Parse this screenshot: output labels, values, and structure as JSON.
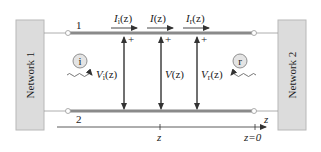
{
  "diagram": {
    "colors": {
      "network_fill": "#dcdcdc",
      "network_stroke": "#b8b8b8",
      "conductor": "#8a8a8a",
      "wire": "#9a9a9a",
      "arrow": "#333333",
      "text": "#222222"
    },
    "networks": [
      {
        "id": "network-1",
        "label": "Network 1"
      },
      {
        "id": "network-2",
        "label": "Network 2"
      }
    ],
    "conductors": [
      {
        "id": "conductor-1",
        "label": "1"
      },
      {
        "id": "conductor-2",
        "label": "2"
      }
    ],
    "currents": [
      {
        "id": "incident-current",
        "symbol": "I",
        "subscript": "i",
        "arg": "(z)"
      },
      {
        "id": "total-current",
        "symbol": "I",
        "subscript": "",
        "arg": "(z)"
      },
      {
        "id": "reflected-current",
        "symbol": "I",
        "subscript": "r",
        "arg": "(z)"
      }
    ],
    "voltages": [
      {
        "id": "incident-voltage",
        "symbol": "V",
        "subscript": "i",
        "arg": "(z)",
        "polarity": "+"
      },
      {
        "id": "total-voltage",
        "symbol": "V",
        "subscript": "",
        "arg": "(z)",
        "polarity": "+"
      },
      {
        "id": "reflected-voltage",
        "symbol": "V",
        "subscript": "r",
        "arg": "(z)",
        "polarity": "+"
      }
    ],
    "waves": [
      {
        "id": "incident-wave",
        "badge": "i",
        "direction": "right"
      },
      {
        "id": "reflected-wave",
        "badge": "r",
        "direction": "left"
      }
    ],
    "axis": {
      "label": "z",
      "ticks": [
        {
          "label": "z"
        },
        {
          "label": "z=0"
        }
      ]
    }
  }
}
